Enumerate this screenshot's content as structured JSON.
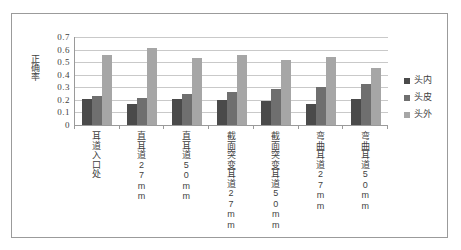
{
  "chart_data": {
    "type": "bar",
    "title": "",
    "xlabel": "",
    "ylabel": "正确率",
    "ylim": [
      0,
      0.7
    ],
    "ytick_labels": [
      "0.7",
      "0.6",
      "0.5",
      "0.4",
      "0.3",
      "0.2",
      "0.1",
      "0"
    ],
    "ytick_values": [
      0.7,
      0.6,
      0.5,
      0.4,
      0.3,
      0.2,
      0.1,
      0
    ],
    "grid": true,
    "legend_position": "right",
    "categories": [
      "耳道入口处",
      "直耳道27mm",
      "直耳道50mm",
      "截面突变耳道27mm",
      "截面突变耳道50mm",
      "弯曲耳道27mm",
      "弯曲耳道50mm"
    ],
    "series": [
      {
        "name": "头内",
        "color": "#4a4a4a",
        "values": [
          0.21,
          0.17,
          0.21,
          0.2,
          0.195,
          0.17,
          0.205
        ]
      },
      {
        "name": "头皮",
        "color": "#6f6f6f",
        "values": [
          0.23,
          0.215,
          0.245,
          0.265,
          0.285,
          0.3,
          0.325
        ]
      },
      {
        "name": "头外",
        "color": "#a6a6a6",
        "values": [
          0.555,
          0.61,
          0.535,
          0.555,
          0.515,
          0.54,
          0.455
        ]
      }
    ]
  }
}
